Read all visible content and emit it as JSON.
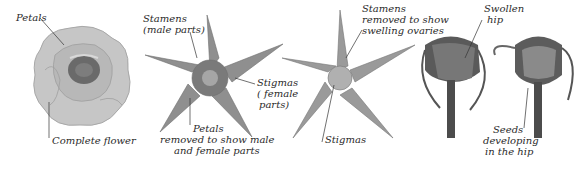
{
  "figure": {
    "panels": [
      {
        "id": "complete-flower",
        "labels": {
          "petals": "Petals",
          "caption": "Complete flower"
        }
      },
      {
        "id": "petals-removed",
        "labels": {
          "stamens_l1": "Stamens",
          "stamens_l2": "(male parts)",
          "stigmas_l1": "Stigmas",
          "stigmas_l2": "( female",
          "stigmas_l3": "parts)",
          "petals_l1": "Petals",
          "petals_l2": "removed to show male",
          "petals_l3": "and female parts"
        }
      },
      {
        "id": "stamens-removed",
        "labels": {
          "stamens_l1": "Stamens",
          "stamens_l2": "removed to show",
          "stamens_l3": "swelling ovaries",
          "stigmas": "Stigmas"
        }
      },
      {
        "id": "hips",
        "labels": {
          "swollen_l1": "Swollen",
          "swollen_l2": "hip",
          "seeds_l1": "Seeds",
          "seeds_l2": "developing",
          "seeds_l3": "in the hip"
        }
      }
    ],
    "colors": {
      "petal": "#c9c9c9",
      "petal_dark": "#9c9c9c",
      "center": "#5e5e5e",
      "sepal": "#8a8a8a",
      "stem": "#4a4a4a",
      "leader": "#333333"
    }
  }
}
